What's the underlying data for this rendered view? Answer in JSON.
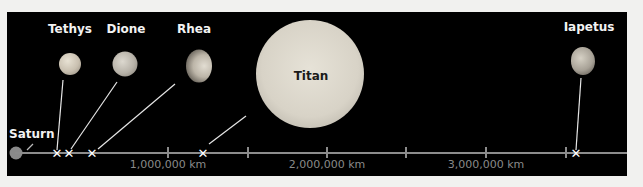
{
  "diagram": {
    "colors": {
      "background": "#000000",
      "page": "#f1f1ef",
      "axis": "#8c8c8c",
      "label": "#f2f2f2",
      "tick_label": "#8a8a8a",
      "marker": "#ffffff"
    },
    "origin": {
      "label": "Saturn"
    },
    "moons": [
      {
        "name": "Tethys",
        "distance_km": 295000
      },
      {
        "name": "Dione",
        "distance_km": 377000
      },
      {
        "name": "Rhea",
        "distance_km": 527000
      },
      {
        "name": "Titan",
        "distance_km": 1222000
      },
      {
        "name": "Iapetus",
        "distance_km": 3561000
      }
    ],
    "axis": {
      "tick_labels": [
        "1,000,000 km",
        "2,000,000 km",
        "3,000,000 km"
      ],
      "marker_glyph": "✕"
    }
  }
}
